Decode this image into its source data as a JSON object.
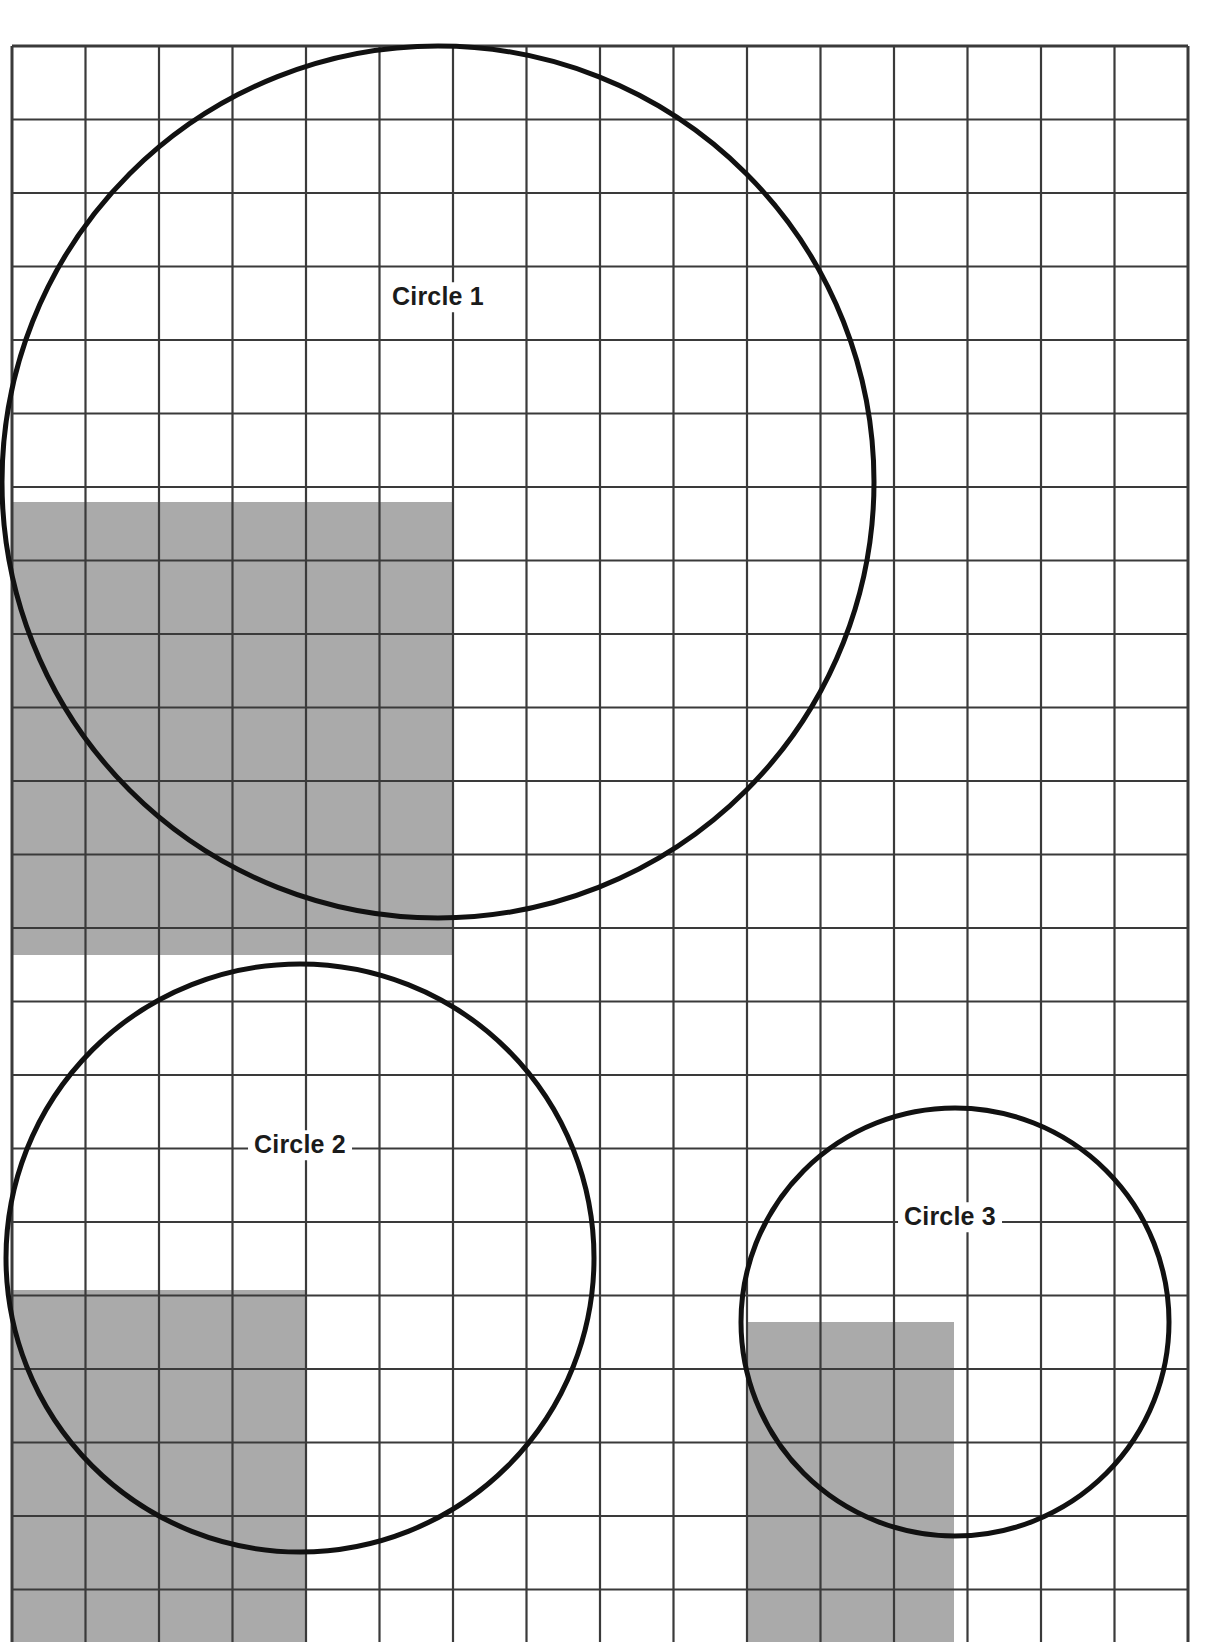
{
  "page": {
    "background_color": "#ffffff",
    "width": 1210,
    "height": 1642
  },
  "grid": {
    "name": "square-grid",
    "origin_x": 12,
    "origin_y": 46,
    "cell_size": 73.5,
    "columns": 16,
    "rows": 22,
    "line_color": "#3a3a3a",
    "line_width": 2.2,
    "outer_border_width": 3
  },
  "style": {
    "circle_stroke": "#111111",
    "circle_stroke_width": 5,
    "shaded_fill": "#aaaaaa",
    "shaded_fill_label": "gray"
  },
  "shapes": {
    "circles": [
      {
        "label": "Circle 1",
        "center_x": 438,
        "center_y": 482,
        "radius": 436,
        "label_x": 438,
        "label_y": 297,
        "diameter_cells": 11.9
      },
      {
        "label": "Circle 2",
        "center_x": 300,
        "center_y": 1258,
        "radius": 294,
        "label_x": 300,
        "label_y": 1145,
        "diameter_cells": 8.0
      },
      {
        "label": "Circle 3",
        "center_x": 955,
        "center_y": 1322,
        "radius": 214,
        "label_x": 950,
        "label_y": 1217,
        "diameter_cells": 5.8
      }
    ],
    "shaded_rects": [
      {
        "name": "shaded-region-circle-1",
        "x": 12,
        "y": 502,
        "width": 441,
        "height": 453,
        "cols": 6,
        "rows": 6
      },
      {
        "name": "shaded-region-circle-2",
        "x": 12,
        "y": 1290,
        "width": 294,
        "height": 352,
        "cols": 4,
        "rows": 4.8
      },
      {
        "name": "shaded-region-circle-3",
        "x": 746,
        "y": 1322,
        "width": 208,
        "height": 320,
        "cols": 3,
        "rows": 4.3
      }
    ]
  },
  "chart_data": {
    "type": "diagram",
    "grid_unit": "1 square",
    "items": [
      {
        "name": "Circle 1",
        "diameter_squares": 12,
        "radius_squares": 6,
        "shaded_squares": 36,
        "shaded_region_cols": 6,
        "shaded_region_rows": 6
      },
      {
        "name": "Circle 2",
        "diameter_squares": 8,
        "radius_squares": 4,
        "shaded_squares": 16,
        "shaded_region_cols": 4,
        "shaded_region_rows": 4
      },
      {
        "name": "Circle 3",
        "diameter_squares": 6,
        "radius_squares": 3,
        "shaded_squares": 9,
        "shaded_region_cols": 3,
        "shaded_region_rows": 3
      }
    ],
    "legend": [
      "Circle 1",
      "Circle 2",
      "Circle 3"
    ],
    "xlabel": "",
    "ylabel": ""
  }
}
